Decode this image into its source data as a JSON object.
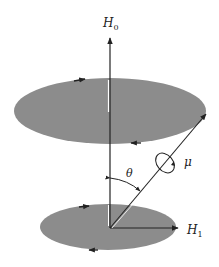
{
  "diagram": {
    "type": "precession-diagram",
    "labels": {
      "field_h0": "H",
      "field_h0_sub": "0",
      "field_h1": "H",
      "field_h1_sub": "1",
      "angle": "θ",
      "moment": "μ"
    },
    "colors": {
      "disk_fill": "#8c8c8c",
      "line": "#222222",
      "background": "#ffffff"
    },
    "elements": [
      {
        "id": "top-disk",
        "shape": "ellipse",
        "description": "upper precession disk with circulation arrows"
      },
      {
        "id": "bottom-disk",
        "shape": "ellipse",
        "description": "lower precession disk with circulation arrows"
      },
      {
        "id": "h0-axis",
        "shape": "arrow",
        "direction": "up",
        "label": "H0"
      },
      {
        "id": "h1-axis",
        "shape": "arrow",
        "direction": "right",
        "label": "H1"
      },
      {
        "id": "mu-vector",
        "shape": "arrow",
        "direction": "up-right",
        "label": "μ"
      },
      {
        "id": "theta-arc",
        "shape": "arc",
        "label": "θ"
      }
    ]
  }
}
